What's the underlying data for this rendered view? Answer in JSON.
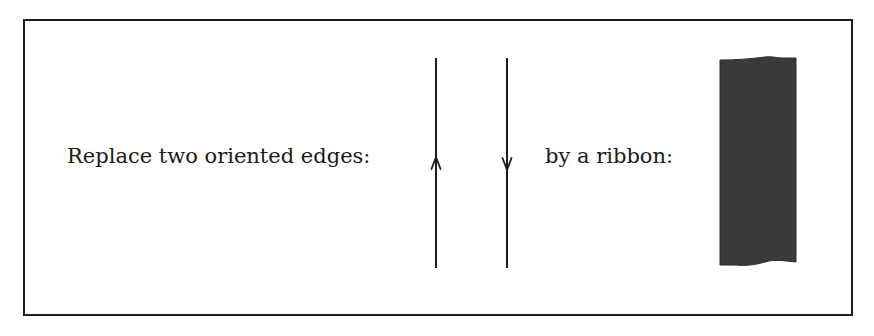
{
  "figure": {
    "left_label": "Replace two oriented edges:",
    "right_label": "by a ribbon:",
    "edges": [
      {
        "name": "edge-up",
        "x": 436,
        "y_top": 58,
        "y_bottom": 268,
        "direction": "up"
      },
      {
        "name": "edge-down",
        "x": 507,
        "y_top": 58,
        "y_bottom": 268,
        "direction": "down"
      }
    ],
    "ribbon": {
      "color": "#3a3a3a",
      "x_left": 720,
      "x_right": 796,
      "y_top": 58,
      "y_bottom": 265
    },
    "border_color": "#1e1e1e",
    "line_color": "#1e1e1e"
  }
}
